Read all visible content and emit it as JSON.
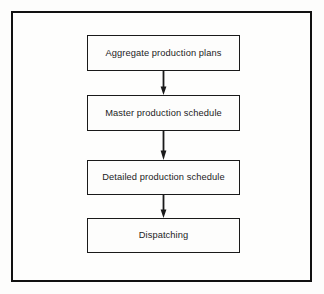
{
  "figure": {
    "type": "flowchart",
    "orientation": "vertical-top-to-bottom",
    "frame": {
      "border_color": "#111111",
      "background_color": "#fefefd"
    },
    "node_style": {
      "shape": "rectangle",
      "border_color": "#1a1a1a",
      "fill_color": "#fdfdfc",
      "text_color": "#1c1c1c"
    },
    "connector_style": {
      "kind": "arrow",
      "color": "#1a1a1a",
      "head": "solid-triangle",
      "direction": "down"
    },
    "nodes": [
      {
        "id": "node-1",
        "label": "Aggregate production plans"
      },
      {
        "id": "node-2",
        "label": "Master production schedule"
      },
      {
        "id": "node-3",
        "label": "Detailed production schedule"
      },
      {
        "id": "node-4",
        "label": "Dispatching"
      }
    ],
    "connectors": [
      {
        "id": "arrow-1",
        "from": "node-1",
        "to": "node-2"
      },
      {
        "id": "arrow-2",
        "from": "node-2",
        "to": "node-3"
      },
      {
        "id": "arrow-3",
        "from": "node-3",
        "to": "node-4"
      }
    ]
  }
}
